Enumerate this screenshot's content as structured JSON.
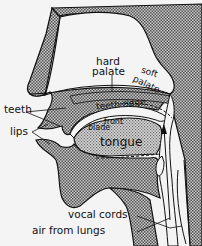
{
  "colors": {
    "background": "#f4f4f4",
    "tissue_fill": "#8c8c8c",
    "tongue_fill": "#a8a8a8",
    "outline": "#111111"
  },
  "labels": {
    "hard_palate_1": "hard",
    "hard_palate_2": "palate",
    "soft_palate_1": "soft",
    "soft_palate_2": "palate",
    "teeth_ridge": "teeth ridge",
    "front": "front",
    "blade": "blade",
    "tongue": "tongue",
    "teeth": "teeth",
    "lips": "lips",
    "vocal_cords": "vocal cords",
    "air_from_lungs": "air from lungs"
  }
}
